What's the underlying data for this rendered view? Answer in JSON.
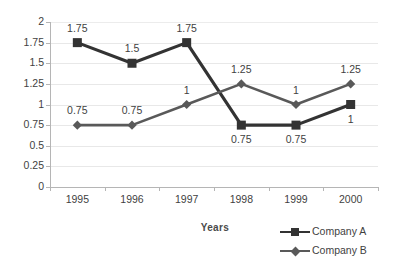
{
  "chart_data": {
    "type": "line",
    "title": "",
    "xlabel": "Years",
    "ylabel": "",
    "categories": [
      "1995",
      "1996",
      "1997",
      "1998",
      "1999",
      "2000"
    ],
    "ylim": [
      0,
      2
    ],
    "yticks": [
      "0",
      "0.25",
      "0.5",
      "0.75",
      "1",
      "1.25",
      "1.5",
      "1.75",
      "2"
    ],
    "ytick_values": [
      0,
      0.25,
      0.5,
      0.75,
      1,
      1.25,
      1.5,
      1.75,
      2
    ],
    "grid": true,
    "legend_position": "bottom-right",
    "series": [
      {
        "name": "Company A",
        "marker": "square",
        "color": "#333333",
        "values": [
          1.75,
          1.5,
          1.75,
          0.75,
          0.75,
          1
        ],
        "labels": [
          "1.75",
          "1.5",
          "1.75",
          "0.75",
          "0.75",
          "1"
        ],
        "label_positions": [
          "above",
          "above",
          "above",
          "below",
          "below",
          "below"
        ]
      },
      {
        "name": "Company B",
        "marker": "diamond",
        "color": "#595959",
        "values": [
          0.75,
          0.75,
          1,
          1.25,
          1,
          1.25
        ],
        "labels": [
          "0.75",
          "0.75",
          "1",
          "1.25",
          "1",
          "1.25"
        ],
        "label_positions": [
          "above",
          "above",
          "above",
          "above",
          "above",
          "above"
        ]
      }
    ]
  },
  "legend": {
    "items": [
      {
        "label": "Company A"
      },
      {
        "label": "Company B"
      }
    ]
  },
  "colors": {
    "series_a": "#333333",
    "series_b": "#595959",
    "gridline": "#e8e8e8",
    "axis": "#b5b5b5",
    "text": "#3f3f3f",
    "background": "#ffffff"
  }
}
